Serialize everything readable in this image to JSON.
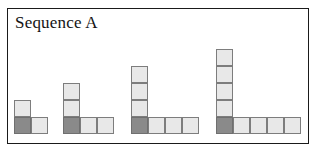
{
  "panel": {
    "title": "Sequence A",
    "border_color": "#1a1a1a",
    "background_color": "#ffffff"
  },
  "palette": {
    "light_cell_fill": "#e8e8e8",
    "dark_cell_fill": "#8a8a8a",
    "cell_stroke": "#7d7d7d"
  },
  "geometry": {
    "cell_size": 17,
    "baseline_y": 134,
    "frame_left": 7,
    "frame_top": 8,
    "frame_width": 302,
    "frame_height": 136
  },
  "chart_data": {
    "type": "diagram",
    "title": "Sequence A",
    "categories": [
      "Term 1",
      "Term 2",
      "Term 3",
      "Term 4"
    ],
    "values": [
      3,
      5,
      7,
      9
    ],
    "series": [
      {
        "name": "vertical arm (light squares above corner)",
        "values": [
          1,
          2,
          3,
          4
        ]
      },
      {
        "name": "horizontal arm (light squares right of corner)",
        "values": [
          1,
          2,
          3,
          4
        ]
      },
      {
        "name": "corner square (dark)",
        "values": [
          1,
          1,
          1,
          1
        ]
      },
      {
        "name": "total squares",
        "values": [
          3,
          5,
          7,
          9
        ]
      }
    ],
    "xlabel": "",
    "ylabel": "",
    "legend": []
  },
  "figures": [
    {
      "name": "term-1",
      "left": 14,
      "vertical_light": 1,
      "horizontal_light": 1,
      "total_cells": 3
    },
    {
      "name": "term-2",
      "left": 63,
      "vertical_light": 2,
      "horizontal_light": 2,
      "total_cells": 5
    },
    {
      "name": "term-3",
      "left": 131,
      "vertical_light": 3,
      "horizontal_light": 3,
      "total_cells": 7
    },
    {
      "name": "term-4",
      "left": 216,
      "vertical_light": 4,
      "horizontal_light": 4,
      "total_cells": 9
    }
  ]
}
